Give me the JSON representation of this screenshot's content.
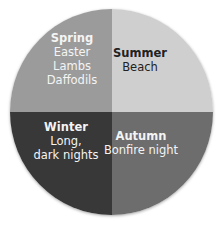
{
  "diagram": {
    "type": "four-quadrant circle",
    "quadrants": [
      {
        "id": "spring",
        "title": "Spring",
        "lines": [
          "Easter",
          "Lambs",
          "Daffodils"
        ],
        "color": "#9b9b9b",
        "text_color": "#f4f4f4"
      },
      {
        "id": "summer",
        "title": "Summer",
        "lines": [
          "Beach"
        ],
        "color": "#cfcfcf",
        "text_color": "#222222"
      },
      {
        "id": "winter",
        "title": "Winter",
        "lines": [
          "Long,",
          "dark nights"
        ],
        "color": "#383838",
        "text_color": "#f4f4f4"
      },
      {
        "id": "autumn",
        "title": "Autumn",
        "lines": [
          "Bonfire night"
        ],
        "color": "#6d6d6d",
        "text_color": "#f4f4f4"
      }
    ]
  }
}
